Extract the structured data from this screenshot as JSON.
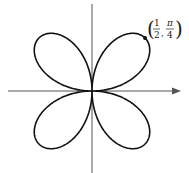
{
  "figure": {
    "curve": "four-leaved rose",
    "equation": "r = sin(2θ) (scaled so max r = 1/2)",
    "max_r": 0.5,
    "petals": 4,
    "marked_point": {
      "r_num": "1",
      "r_den": "2",
      "theta_num": "π",
      "theta_den": "4",
      "r_value": 0.5,
      "theta_value_rad": 0.7853981634
    },
    "colors": {
      "curve": "#111111",
      "axes": "#555555",
      "background": "#ffffff"
    }
  }
}
